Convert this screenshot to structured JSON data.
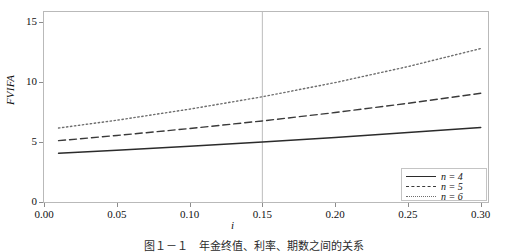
{
  "chart_data": {
    "type": "line",
    "title": "",
    "xlabel": "i",
    "ylabel": "FVIFA",
    "xlim": [
      0.0,
      0.305
    ],
    "ylim": [
      0.0,
      15.8
    ],
    "xticks": [
      "0.00",
      "0.05",
      "0.10",
      "0.15",
      "0.20",
      "0.25",
      "0.30"
    ],
    "xtick_values": [
      0.0,
      0.05,
      0.1,
      0.15,
      0.2,
      0.25,
      0.3
    ],
    "yticks": [
      "0",
      "5",
      "10",
      "15"
    ],
    "ytick_values": [
      0,
      5,
      10,
      15
    ],
    "grid": false,
    "reference_lines": [
      {
        "axis": "x",
        "value": 0.15,
        "style": "solid-thin",
        "color": "#b5b5b5"
      }
    ],
    "legend_position": "lower right",
    "x": [
      0.01,
      0.05,
      0.1,
      0.15,
      0.2,
      0.25,
      0.3
    ],
    "series": [
      {
        "name": "n = 4",
        "n": 4,
        "style": "solid",
        "color": "#2b2b2b",
        "values": [
          4.06,
          4.31,
          4.64,
          4.99,
          5.37,
          5.77,
          6.19
        ]
      },
      {
        "name": "n = 5",
        "n": 5,
        "style": "dashed",
        "color": "#3a3a3a",
        "values": [
          5.1,
          5.53,
          6.11,
          6.74,
          7.44,
          8.21,
          9.04
        ]
      },
      {
        "name": "n = 6",
        "n": 6,
        "style": "dotted",
        "color": "#6e6e6e",
        "values": [
          6.15,
          6.8,
          7.72,
          8.75,
          9.93,
          11.26,
          12.76
        ]
      }
    ]
  },
  "legend": {
    "entries": [
      {
        "label": "n = 4",
        "style": "solid"
      },
      {
        "label": "n = 5",
        "style": "dashed"
      },
      {
        "label": "n = 6",
        "style": "dotted"
      }
    ]
  },
  "caption": {
    "text": "图１－１　年金终值、利率、期数之间的关系"
  }
}
